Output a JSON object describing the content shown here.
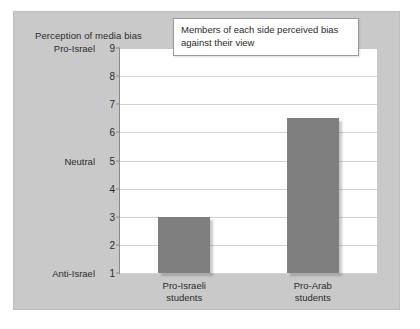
{
  "figure": {
    "panel_color": "#c9c9c9",
    "plot_background": "#ffffff",
    "bar_color": "#7f7f7f"
  },
  "annotation": {
    "text": "Members of each side perceived bias against their view"
  },
  "chart_data": {
    "type": "bar",
    "title": "Perception of media bias",
    "xlabel": "",
    "ylabel": "",
    "categories": [
      "Pro-Israeli students",
      "Pro-Arab students"
    ],
    "category_lines": [
      [
        "Pro-Israeli",
        "students"
      ],
      [
        "Pro-Arab",
        "students"
      ]
    ],
    "values": [
      3.0,
      6.5
    ],
    "ylim": [
      1,
      9
    ],
    "yticks": [
      1,
      2,
      3,
      4,
      5,
      6,
      7,
      8,
      9
    ],
    "ytick_labels": [
      "1",
      "2",
      "3",
      "4",
      "5",
      "6",
      "7",
      "8",
      "9"
    ],
    "y_scale_names": [
      {
        "value": 9,
        "label": "Pro-Israel"
      },
      {
        "value": 5,
        "label": "Neutral"
      },
      {
        "value": 1,
        "label": "Anti-Israel"
      }
    ],
    "grid": true,
    "legend": false,
    "annotations": [
      {
        "text": "Members of each side perceived bias against their view"
      }
    ]
  }
}
